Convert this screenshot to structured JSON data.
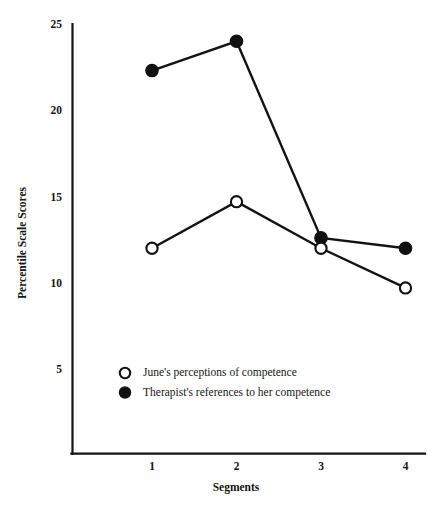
{
  "chart_data": {
    "type": "line",
    "title": "",
    "subtitle": "",
    "xlabel": "Segments",
    "ylabel": "Percentile  Scale  Scores",
    "categories": [
      "1",
      "2",
      "3",
      "4"
    ],
    "x": [
      1,
      2,
      3,
      4
    ],
    "xlim": [
      0.35,
      4.0
    ],
    "ylim": [
      0,
      25
    ],
    "y_ticks": [
      "25",
      "20",
      "15",
      "10",
      "5"
    ],
    "y_tick_values": [
      25,
      20,
      15,
      10,
      5
    ],
    "x_ticks": [
      "1",
      "2",
      "3",
      "4"
    ],
    "grid": false,
    "legend_position": "lower-left-inside",
    "series": [
      {
        "name": "June's perceptions of competence",
        "marker": "open-circle",
        "color": "#111111",
        "values": [
          12.0,
          14.7,
          12.0,
          9.7
        ]
      },
      {
        "name": "Therapist's references to her competence",
        "marker": "filled-circle",
        "color": "#111111",
        "values": [
          22.3,
          24.0,
          12.6,
          12.0
        ]
      }
    ],
    "legend": [
      {
        "marker": "open-circle",
        "label": "June's perceptions of competence"
      },
      {
        "marker": "filled-circle",
        "label": "Therapist's references to her competence"
      }
    ],
    "annotations": []
  }
}
